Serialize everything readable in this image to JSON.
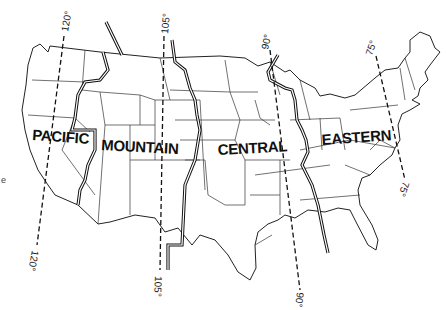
{
  "map": {
    "title": "",
    "subject": "United States time zones",
    "zones": [
      {
        "id": "pacific",
        "label": "PACIFIC"
      },
      {
        "id": "mountain",
        "label": "MOUNTAIN"
      },
      {
        "id": "central",
        "label": "CENTRAL"
      },
      {
        "id": "eastern",
        "label": "EASTERN"
      }
    ],
    "meridians": [
      {
        "id": "m120",
        "label_top": "120°",
        "label_bottom": "120°"
      },
      {
        "id": "m105",
        "label_top": "105°",
        "label_bottom": "105°"
      },
      {
        "id": "m90",
        "label_top": "90°",
        "label_bottom": "90°"
      },
      {
        "id": "m75",
        "label_top": "75°",
        "label_bottom": "75°"
      }
    ],
    "stray_mark": "e",
    "colors": {
      "background": "#ffffff",
      "ink": "#111111"
    }
  }
}
